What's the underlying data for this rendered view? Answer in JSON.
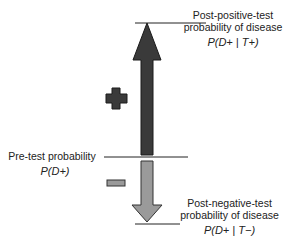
{
  "diagram": {
    "top_label": {
      "line1": "Post-positive-test",
      "line2": "probability of disease",
      "formula": "P(D+ | T+)"
    },
    "middle_label": {
      "line1": "Pre-test probability",
      "formula": "P(D+)"
    },
    "bottom_label": {
      "line1": "Post-negative-test",
      "line2": "probability of disease",
      "formula": "P(D+ | T−)"
    },
    "symbols": {
      "plus": "positive-test-symbol",
      "minus": "negative-test-symbol"
    },
    "colors": {
      "up_arrow": "#3a3a3a",
      "down_arrow": "#9a9a9a",
      "plus_sign": "#3a3a3a",
      "minus_sign": "#9a9a9a",
      "lines": "#222222"
    }
  }
}
